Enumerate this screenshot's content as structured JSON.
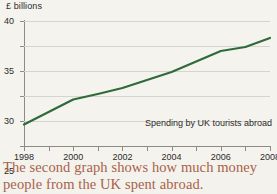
{
  "figure": {
    "background_color": "#f5f3ee",
    "caption": {
      "line_1": "The second graph shows how much money",
      "line_2": "people from the UK spent abroad.",
      "color": "#a8624a"
    }
  },
  "chart_data": {
    "type": "line",
    "title": "",
    "ylabel": "£ billions",
    "xlabel": "",
    "annotation": "Spending by UK tourists abroad",
    "line_color": "#2f6b3a",
    "grid": true,
    "legend": "none",
    "ylim": [
      15,
      40
    ],
    "xlim": [
      1998,
      2008
    ],
    "yticks": [
      40,
      35,
      30,
      25,
      20,
      15
    ],
    "ytick_labels": [
      "40",
      "35",
      "30",
      "25",
      "20",
      "15"
    ],
    "xticks": [
      1998,
      1999,
      2000,
      2001,
      2002,
      2003,
      2004,
      2005,
      2006,
      2007,
      2008
    ],
    "xtick_labels": [
      "1998",
      "",
      "2000",
      "",
      "2002",
      "",
      "2004",
      "",
      "2006",
      "",
      "2008"
    ],
    "x": [
      1998,
      1999,
      2000,
      2001,
      2002,
      2003,
      2004,
      2005,
      2006,
      2007,
      2008
    ],
    "values": [
      19.3,
      21.8,
      24.3,
      25.4,
      26.6,
      28.2,
      29.8,
      31.9,
      34.0,
      34.8,
      36.6
    ],
    "series": [
      {
        "name": "Spending by UK tourists abroad",
        "values": [
          19.3,
          21.8,
          24.3,
          25.4,
          26.6,
          28.2,
          29.8,
          31.9,
          34.0,
          34.8,
          36.6
        ]
      }
    ]
  }
}
